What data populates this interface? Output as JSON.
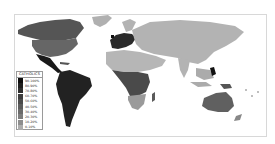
{
  "map": {
    "type": "choropleth world map",
    "legend": {
      "title": "CATHOLICS",
      "items": [
        {
          "label": "90-100%",
          "color": "#0e0e0e"
        },
        {
          "label": "80-90%",
          "color": "#1f1f1f"
        },
        {
          "label": "70-80%",
          "color": "#2f2f2f"
        },
        {
          "label": "60-70%",
          "color": "#3d3d3d"
        },
        {
          "label": "50-60%",
          "color": "#4c4c4c"
        },
        {
          "label": "40-50%",
          "color": "#5c5c5c"
        },
        {
          "label": "30-40%",
          "color": "#6b6b6b"
        },
        {
          "label": "20-30%",
          "color": "#7c7c7c"
        },
        {
          "label": "10-20%",
          "color": "#8e8e8e"
        },
        {
          "label": "0-10%",
          "color": "#adadad"
        }
      ]
    },
    "regions": {
      "north_america_canada": "#555555",
      "united_states": "#666666",
      "mexico_central_america": "#1a1a1a",
      "south_america": "#222222",
      "greenland": "#b0b0b0",
      "europe_west": "#2a2a2a",
      "eurasia": "#b3b3b3",
      "north_africa_middle_east": "#b6b6b6",
      "central_africa": "#4a4a4a",
      "southern_africa": "#9a9a9a",
      "madagascar": "#5a5a5a",
      "australia": "#606060",
      "philippines": "#111111",
      "southeast_asia": "#ababab"
    }
  }
}
